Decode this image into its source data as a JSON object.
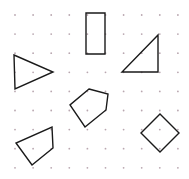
{
  "canvas": {
    "width": 189,
    "height": 179,
    "background": "#ffffff",
    "title": "dot-grid-polygon-figure"
  },
  "grid": {
    "dot_color": "#b9a7b0",
    "dot_radius": 0.9,
    "origin_x": 15,
    "origin_y": 15,
    "spacing_x": 18.1,
    "spacing_y": 19.1,
    "cols": 10,
    "rows": 9
  },
  "style": {
    "stroke_color": "#1a1a1a",
    "stroke_width": 1.4,
    "fill": "none"
  },
  "shapes": [
    {
      "name": "left-triangle",
      "label": "Triangle pointing right",
      "sides": 3,
      "points": "14,55 53,72 15,89"
    },
    {
      "name": "top-rectangle",
      "label": "Vertical rectangle",
      "sides": 4,
      "points": "86,13 105,13 105,54 86,54"
    },
    {
      "name": "top-right-triangle",
      "label": "Right triangle",
      "sides": 3,
      "points": "158,35 158,72 122,72"
    },
    {
      "name": "center-pentagon",
      "label": "Pentagon",
      "sides": 5,
      "points": "89,89 108,94 106,110 85,127 70,105"
    },
    {
      "name": "bottom-left-quadrilateral",
      "label": "Quadrilateral",
      "sides": 4,
      "points": "52,127 53,148 32,165 16,143"
    },
    {
      "name": "bottom-right-diamond",
      "label": "Diamond",
      "sides": 4,
      "points": "160,114 179,133 160,152 141,133"
    }
  ]
}
